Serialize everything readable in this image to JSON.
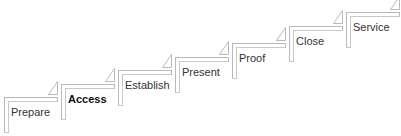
{
  "diagram": {
    "type": "staircase-process",
    "steps": [
      {
        "label": "Prepare",
        "x": 4,
        "y": 97,
        "emphasized": false
      },
      {
        "label": "Access",
        "x": 61,
        "y": 84,
        "emphasized": true
      },
      {
        "label": "Establish",
        "x": 118,
        "y": 70,
        "emphasized": false
      },
      {
        "label": "Present",
        "x": 175,
        "y": 57,
        "emphasized": false
      },
      {
        "label": "Proof",
        "x": 232,
        "y": 43,
        "emphasized": false
      },
      {
        "label": "Close",
        "x": 289,
        "y": 26,
        "emphasized": false
      },
      {
        "label": "Service",
        "x": 346,
        "y": 12,
        "emphasized": false
      }
    ],
    "colors": {
      "line": "#b9b9b9",
      "text": "#333333",
      "emphasis_text": "#111111"
    }
  }
}
